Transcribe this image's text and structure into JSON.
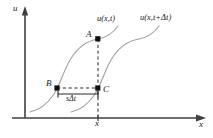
{
  "figure": {
    "axes": {
      "y_label": "u",
      "x_label": "x",
      "x_tick_label": "x",
      "origin": [
        25,
        118
      ],
      "x_axis_end": [
        206,
        118
      ],
      "y_axis_top": [
        25,
        10
      ]
    },
    "points": [
      {
        "id": "A",
        "label": "A",
        "x": 98,
        "y": 39
      },
      {
        "id": "B",
        "label": "B",
        "x": 57,
        "y": 88
      },
      {
        "id": "C",
        "label": "C",
        "x": 98,
        "y": 88
      }
    ],
    "curves": [
      {
        "id": "curve-left",
        "label": "u(x,t)"
      },
      {
        "id": "curve-right",
        "label": "u(x,t+Δt)"
      }
    ],
    "annotations": {
      "shift_label_s": "s",
      "shift_label_delta_t": "Δt",
      "shift_label_full": "sΔt"
    },
    "colors": {
      "axis": "#3f3f3f",
      "curve": "#9a9a9a",
      "dashed": "#2b2b2b",
      "marker": "#111111",
      "text": "#1a1a1a",
      "background": "#ffffff"
    }
  }
}
